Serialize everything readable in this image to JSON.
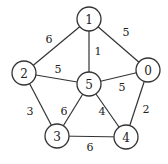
{
  "graph": {
    "nodes": [
      {
        "id": "0",
        "x": 148,
        "y": 70
      },
      {
        "id": "1",
        "x": 89,
        "y": 19
      },
      {
        "id": "2",
        "x": 24,
        "y": 73
      },
      {
        "id": "3",
        "x": 57,
        "y": 136
      },
      {
        "id": "4",
        "x": 126,
        "y": 137
      },
      {
        "id": "5",
        "x": 89,
        "y": 84
      }
    ],
    "edges": [
      {
        "from": "1",
        "to": "2",
        "weight": "6",
        "lx": 49,
        "ly": 40
      },
      {
        "from": "1",
        "to": "5",
        "weight": "1",
        "lx": 98,
        "ly": 52
      },
      {
        "from": "1",
        "to": "0",
        "weight": "5",
        "lx": 126,
        "ly": 33
      },
      {
        "from": "2",
        "to": "5",
        "weight": "5",
        "lx": 58,
        "ly": 70
      },
      {
        "from": "5",
        "to": "0",
        "weight": "5",
        "lx": 122,
        "ly": 88
      },
      {
        "from": "2",
        "to": "3",
        "weight": "3",
        "lx": 30,
        "ly": 112
      },
      {
        "from": "5",
        "to": "3",
        "weight": "6",
        "lx": 64,
        "ly": 112
      },
      {
        "from": "5",
        "to": "4",
        "weight": "4",
        "lx": 102,
        "ly": 112
      },
      {
        "from": "0",
        "to": "4",
        "weight": "2",
        "lx": 146,
        "ly": 110
      },
      {
        "from": "3",
        "to": "4",
        "weight": "6",
        "lx": 90,
        "ly": 148
      }
    ]
  }
}
